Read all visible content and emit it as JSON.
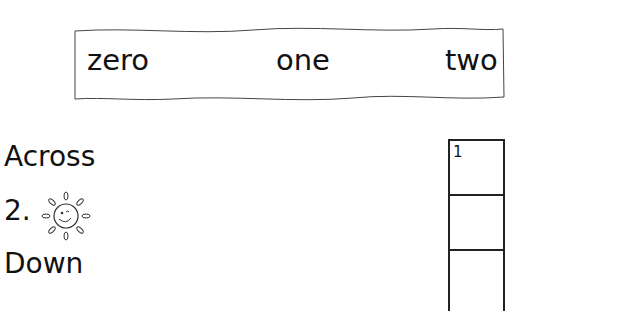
{
  "word_bank": {
    "words": [
      "zero",
      "one",
      "two"
    ]
  },
  "across": {
    "heading": "Across",
    "clues": [
      {
        "number": "2.",
        "icon": "sun-icon"
      }
    ]
  },
  "down": {
    "heading": "Down"
  },
  "grid": {
    "cells": [
      {
        "number": "1"
      },
      {
        "number": ""
      },
      {
        "number": ""
      }
    ]
  }
}
